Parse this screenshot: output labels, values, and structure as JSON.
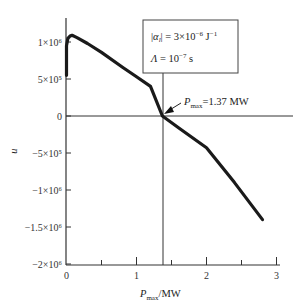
{
  "chart_data": {
    "type": "line",
    "title": "",
    "xlabel": "P_max / MW",
    "xlabel_main": "P",
    "xlabel_sub": "max",
    "xlabel_unit": "/MW",
    "ylabel": "u",
    "xlim": [
      0,
      3
    ],
    "ylim": [
      -2000000,
      1300000
    ],
    "x_ticks": [
      0,
      1,
      2,
      3
    ],
    "x_tick_labels": [
      "0",
      "1",
      "2",
      "3"
    ],
    "x_minor_ticks": [
      0.5,
      1.5,
      2.5
    ],
    "y_ticks": [
      1000000,
      500000,
      0,
      -500000,
      -1000000,
      -1500000,
      -2000000
    ],
    "y_tick_labels": [
      "1×10⁶",
      "5×10⁵",
      "0",
      "−5×10⁵",
      "−1×10⁶",
      "−1.5×10⁶",
      "−2×10⁶"
    ],
    "grid": false,
    "series": [
      {
        "name": "u(P_max)",
        "x": [
          0.0,
          0.0,
          0.02,
          0.05,
          0.08,
          0.15,
          0.3,
          0.5,
          0.8,
          1.0,
          1.2,
          1.37,
          1.6,
          2.0,
          2.4,
          2.8
        ],
        "y": [
          550000,
          950000,
          1050000,
          1080000,
          1090000,
          1060000,
          980000,
          860000,
          660000,
          530000,
          400000,
          0,
          -160000,
          -430000,
          -900000,
          -1400000
        ]
      }
    ],
    "annotations": {
      "param_box_line1": "|α_l| = 3×10⁻⁶ J⁻¹",
      "param_box_line2": "Λ = 10⁻⁷ s",
      "pmax_label_main": "P",
      "pmax_label_sub": "max",
      "pmax_label_value": "=1.37 MW",
      "pmax_value": 1.37
    }
  }
}
